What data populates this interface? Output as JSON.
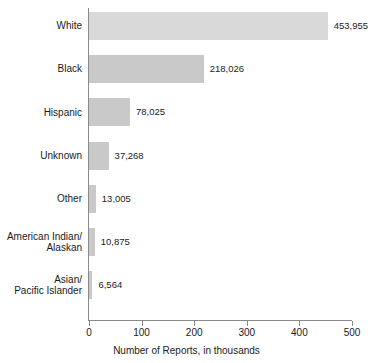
{
  "chart_data": {
    "type": "bar",
    "orientation": "horizontal",
    "title": "",
    "xlabel": "Number of Reports, in thousands",
    "ylabel": "",
    "xlim": [
      0,
      500
    ],
    "xticks": [
      "0",
      "100",
      "200",
      "300",
      "400",
      "500"
    ],
    "grid": false,
    "legend": "none",
    "categories": [
      "White",
      "Black",
      "Hispanic",
      "Unknown",
      "Other",
      "American Indian/\nAlaskan",
      "Asian/\nPacific Islander"
    ],
    "values": [
      453955,
      218026,
      78025,
      37268,
      13005,
      10875,
      6564
    ],
    "value_labels": [
      "453,955",
      "218,026",
      "78,025",
      "37,268",
      "13,005",
      "10,875",
      "6,564"
    ],
    "units": "reports",
    "value_scale_note": "bar lengths plotted in thousands",
    "bar_color": "#d9d9d9",
    "bar_color_alt": "#c9c9c9",
    "axis_color": "#8a8a8a"
  }
}
